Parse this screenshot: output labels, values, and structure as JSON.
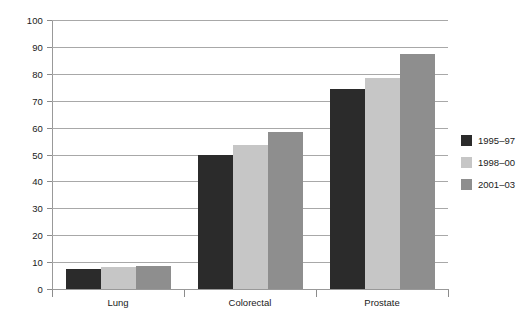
{
  "chart_data": {
    "type": "bar",
    "title": "",
    "subtitle": "",
    "xlabel": "",
    "ylabel": "",
    "categories": [
      "Lung",
      "Colorectal",
      "Prostate"
    ],
    "series": [
      {
        "name": "1995–97",
        "color": "#2b2b2b",
        "values": [
          7.5,
          49.8,
          74.5
        ]
      },
      {
        "name": "1998–00",
        "color": "#c6c6c6",
        "values": [
          8.0,
          53.4,
          78.5
        ]
      },
      {
        "name": "2001–03",
        "color": "#8e8e8e",
        "values": [
          8.5,
          58.5,
          87.3
        ]
      }
    ],
    "ylim": [
      0,
      100
    ],
    "ytick_step": 10,
    "yticks": [
      0,
      10,
      20,
      30,
      40,
      50,
      60,
      70,
      80,
      90,
      100
    ],
    "ytick_labels": [
      "0",
      "10",
      "20",
      "30",
      "40",
      "50",
      "60",
      "70",
      "80",
      "90",
      "100"
    ],
    "grid": true,
    "grid_axis": "y",
    "legend_position": "right"
  },
  "legend": {
    "entries": [
      {
        "label": "1995–97"
      },
      {
        "label": "1998–00"
      },
      {
        "label": "2001–03"
      }
    ]
  },
  "colors": {
    "series_1": "#2b2b2b",
    "series_2": "#c6c6c6",
    "series_3": "#8e8e8e",
    "gridline": "#a8a8a8",
    "axis": "#999999",
    "text": "#1a1a1a",
    "background": "#ffffff"
  }
}
